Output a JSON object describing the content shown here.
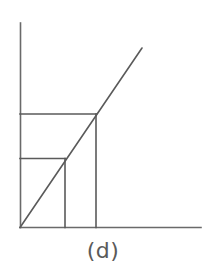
{
  "figure": {
    "caption": "(d)",
    "background_color": "#ffffff",
    "stroke_color": "#5a5a5a",
    "axis_stroke_color": "#6a6a6a",
    "stroke_width": 1.6,
    "canvas": {
      "width": 206,
      "height": 279
    }
  },
  "chart_data": {
    "type": "line",
    "title": "(d)",
    "xlabel": "",
    "ylabel": "",
    "grid": false,
    "legend": null,
    "axes": {
      "origin": [
        20,
        227
      ],
      "y_axis": {
        "x": 20,
        "y_top": 23,
        "y_bottom": 227
      },
      "x_axis": {
        "y": 227,
        "x_left": 20,
        "x_right": 201
      }
    },
    "series": [
      {
        "name": "diagonal-ray",
        "type": "line",
        "points": [
          [
            20,
            227
          ],
          [
            142,
            48
          ]
        ]
      },
      {
        "name": "outer-rectangle",
        "type": "rect",
        "x": 20,
        "y": 114,
        "width": 76,
        "height": 113,
        "corner_on_ray": [
          96,
          114
        ]
      },
      {
        "name": "inner-rectangle",
        "type": "rect",
        "x": 20,
        "y": 158,
        "width": 45,
        "height": 69,
        "corner_on_ray": [
          65,
          158
        ]
      }
    ],
    "annotations": [
      {
        "text": "(d)",
        "x": 103,
        "y": 255,
        "role": "subfigure-label"
      }
    ]
  }
}
